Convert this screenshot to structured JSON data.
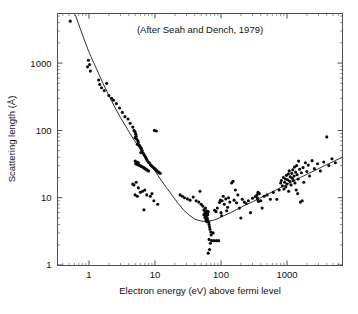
{
  "figure": {
    "title": "",
    "annotation": "(After Seah and Dench, 1979)",
    "background_color": "#ffffff",
    "frame_color": "#4d4d4d",
    "marker_color": "#0b0b0b",
    "curve_color": "#1a1a1a"
  },
  "axes": {
    "x": {
      "label": "Electron energy (eV) above fermi level",
      "scale": "log",
      "range": [
        0.4,
        7000
      ],
      "tick_labels": [
        "1",
        "10",
        "100",
        "1000"
      ],
      "tick_values": [
        1,
        10,
        100,
        1000
      ],
      "minor_ticks": true
    },
    "y": {
      "label": "Scattering length (Å)",
      "scale": "log",
      "range": [
        1,
        6000
      ],
      "tick_labels": [
        "1",
        "10",
        "100",
        "1000"
      ],
      "tick_values": [
        1,
        10,
        100,
        1000
      ],
      "minor_ticks": true
    }
  },
  "chart_data": {
    "type": "scatter",
    "title": "",
    "subtitle": "(After Seah and Dench, 1979)",
    "xlabel": "Electron energy (eV) above fermi level",
    "ylabel": "Scattering length (Å)",
    "xscale": "log",
    "yscale": "log",
    "xlim": [
      0.4,
      7000
    ],
    "ylim": [
      1,
      6000
    ],
    "grid": false,
    "legend": false,
    "series": [
      {
        "name": "Experimental scattering length measurements",
        "marker": "circle",
        "color": "#0b0b0b",
        "points": [
          [
            0.52,
            4200
          ],
          [
            0.95,
            880
          ],
          [
            0.98,
            1100
          ],
          [
            1.02,
            950
          ],
          [
            1.05,
            760
          ],
          [
            1.4,
            560
          ],
          [
            1.45,
            480
          ],
          [
            1.55,
            430
          ],
          [
            1.7,
            390
          ],
          [
            1.85,
            500
          ],
          [
            2.0,
            330
          ],
          [
            2.2,
            300
          ],
          [
            2.35,
            280
          ],
          [
            2.6,
            250
          ],
          [
            2.9,
            215
          ],
          [
            3.2,
            185
          ],
          [
            3.5,
            160
          ],
          [
            3.9,
            148
          ],
          [
            4.2,
            128
          ],
          [
            4.6,
            112
          ],
          [
            4.8,
            100
          ],
          [
            5.0,
            95
          ],
          [
            5.1,
            88
          ],
          [
            5.2,
            82
          ],
          [
            5.0,
            78
          ],
          [
            5.3,
            74
          ],
          [
            5.5,
            70
          ],
          [
            5.6,
            66
          ],
          [
            5.4,
            62
          ],
          [
            5.8,
            60
          ],
          [
            6.0,
            57
          ],
          [
            6.2,
            54
          ],
          [
            6.4,
            50
          ],
          [
            6.1,
            47
          ],
          [
            6.6,
            46
          ],
          [
            6.8,
            44
          ],
          [
            7.0,
            42
          ],
          [
            7.2,
            40
          ],
          [
            7.4,
            38
          ],
          [
            7.6,
            36
          ],
          [
            7.9,
            34
          ],
          [
            8.2,
            33
          ],
          [
            8.5,
            31
          ],
          [
            8.8,
            30
          ],
          [
            9.1,
            29
          ],
          [
            9.5,
            28
          ],
          [
            9.9,
            27
          ],
          [
            10.3,
            26
          ],
          [
            10.7,
            25
          ],
          [
            11.2,
            24
          ],
          [
            11.6,
            23.5
          ],
          [
            12.0,
            23
          ],
          [
            5.0,
            35
          ],
          [
            5.2,
            34
          ],
          [
            5.4,
            33.5
          ],
          [
            5.6,
            33
          ],
          [
            5.1,
            32
          ],
          [
            5.3,
            31.5
          ],
          [
            5.5,
            31
          ],
          [
            5.7,
            30.5
          ],
          [
            5.9,
            30
          ],
          [
            6.1,
            29.5
          ],
          [
            6.3,
            29
          ],
          [
            6.5,
            28.5
          ],
          [
            6.7,
            28
          ],
          [
            6.9,
            27.5
          ],
          [
            7.1,
            27
          ],
          [
            7.3,
            26.5
          ],
          [
            7.5,
            26
          ],
          [
            7.7,
            25.5
          ],
          [
            8.0,
            25
          ],
          [
            9.8,
            100
          ],
          [
            10.5,
            98
          ],
          [
            4.6,
            16
          ],
          [
            4.8,
            15.5
          ],
          [
            5.2,
            17
          ],
          [
            5.6,
            14
          ],
          [
            5.0,
            11
          ],
          [
            5.4,
            10.5
          ],
          [
            6.0,
            12
          ],
          [
            6.5,
            12.5
          ],
          [
            7.0,
            13
          ],
          [
            7.5,
            11
          ],
          [
            6.8,
            6.6
          ],
          [
            8.5,
            10.5
          ],
          [
            9.0,
            11.5
          ],
          [
            9.6,
            9.0
          ],
          [
            11.0,
            8.0
          ],
          [
            24,
            11
          ],
          [
            26,
            10.5
          ],
          [
            28,
            10
          ],
          [
            31,
            9.6
          ],
          [
            34,
            9.2
          ],
          [
            38,
            10.2
          ],
          [
            42,
            9.0
          ],
          [
            46,
            8.6
          ],
          [
            48,
            12.5
          ],
          [
            50,
            8.0
          ],
          [
            53,
            7.5
          ],
          [
            55,
            6.6
          ],
          [
            57,
            6.2
          ],
          [
            58,
            5.8
          ],
          [
            60,
            5.4
          ],
          [
            62,
            5.0
          ],
          [
            63,
            4.6
          ],
          [
            65,
            4.3
          ],
          [
            66,
            4.0
          ],
          [
            67,
            3.7
          ],
          [
            68,
            3.4
          ],
          [
            70,
            3.1
          ],
          [
            71,
            2.8
          ],
          [
            66,
            2.4
          ],
          [
            69,
            2.1
          ],
          [
            67,
            1.7
          ],
          [
            64,
            1.5
          ],
          [
            58,
            7.0
          ],
          [
            60,
            6.4
          ],
          [
            62,
            6.0
          ],
          [
            55,
            5.6
          ],
          [
            57,
            5.1
          ],
          [
            59,
            4.7
          ],
          [
            61,
            4.4
          ],
          [
            63,
            5.6
          ],
          [
            64,
            6.2
          ],
          [
            72,
            2.3
          ],
          [
            78,
            2.3
          ],
          [
            85,
            2.3
          ],
          [
            92,
            2.3
          ],
          [
            76,
            3.0
          ],
          [
            80,
            6.5
          ],
          [
            84,
            6.2
          ],
          [
            88,
            7.0
          ],
          [
            95,
            8.5
          ],
          [
            98,
            9.2
          ],
          [
            100,
            6.0
          ],
          [
            102,
            5.4
          ],
          [
            104,
            9.0
          ],
          [
            108,
            10.5
          ],
          [
            112,
            8.0
          ],
          [
            118,
            9.6
          ],
          [
            122,
            6.4
          ],
          [
            126,
            7.2
          ],
          [
            130,
            10.0
          ],
          [
            136,
            8.6
          ],
          [
            145,
            16.5
          ],
          [
            152,
            17.5
          ],
          [
            158,
            9.2
          ],
          [
            165,
            13.0
          ],
          [
            172,
            8.4
          ],
          [
            180,
            11.0
          ],
          [
            190,
            7.0
          ],
          [
            200,
            5.0
          ],
          [
            210,
            9.5
          ],
          [
            225,
            8.6
          ],
          [
            240,
            8.2
          ],
          [
            260,
            9.0
          ],
          [
            280,
            6.0
          ],
          [
            300,
            9.8
          ],
          [
            330,
            10.4
          ],
          [
            350,
            11.0
          ],
          [
            355,
            10.0
          ],
          [
            360,
            9.4
          ],
          [
            365,
            12.0
          ],
          [
            370,
            8.8
          ],
          [
            380,
            11.5
          ],
          [
            400,
            9.0
          ],
          [
            420,
            7.0
          ],
          [
            450,
            10.5
          ],
          [
            500,
            11.0
          ],
          [
            560,
            9.5
          ],
          [
            620,
            12.0
          ],
          [
            700,
            9.5
          ],
          [
            760,
            13.0
          ],
          [
            800,
            16.5
          ],
          [
            820,
            18.0
          ],
          [
            850,
            15.0
          ],
          [
            880,
            20.0
          ],
          [
            900,
            13.5
          ],
          [
            920,
            17.0
          ],
          [
            950,
            19.0
          ],
          [
            960,
            14.5
          ],
          [
            980,
            21.5
          ],
          [
            1000,
            16.0
          ],
          [
            1020,
            18.5
          ],
          [
            1050,
            22.5
          ],
          [
            1060,
            12.5
          ],
          [
            1080,
            25.0
          ],
          [
            1100,
            17.5
          ],
          [
            1120,
            20.5
          ],
          [
            1150,
            15.5
          ],
          [
            1180,
            23.0
          ],
          [
            1200,
            19.5
          ],
          [
            1220,
            26.0
          ],
          [
            1250,
            18.0
          ],
          [
            1280,
            21.0
          ],
          [
            1300,
            28.5
          ],
          [
            1320,
            16.5
          ],
          [
            1350,
            24.0
          ],
          [
            1380,
            13.0
          ],
          [
            1400,
            30.0
          ],
          [
            1420,
            22.0
          ],
          [
            1450,
            11.5
          ],
          [
            1480,
            19.0
          ],
          [
            1500,
            35.0
          ],
          [
            1550,
            26.5
          ],
          [
            1600,
            8.6
          ],
          [
            1650,
            23.5
          ],
          [
            1700,
            9.0
          ],
          [
            1750,
            28.0
          ],
          [
            1800,
            17.0
          ],
          [
            1900,
            33.0
          ],
          [
            2000,
            24.5
          ],
          [
            2100,
            30.5
          ],
          [
            2200,
            21.0
          ],
          [
            2400,
            35.5
          ],
          [
            2600,
            27.0
          ],
          [
            2900,
            32.0
          ],
          [
            3200,
            25.0
          ],
          [
            3600,
            34.0
          ],
          [
            4000,
            80.0
          ],
          [
            4300,
            30.0
          ],
          [
            4800,
            38.0
          ],
          [
            5400,
            33.0
          ]
        ]
      }
    ],
    "fit_curve": {
      "name": "Universal curve fit",
      "color": "#1a1a1a",
      "points": [
        [
          0.62,
          5200
        ],
        [
          0.8,
          2600
        ],
        [
          1.0,
          1450
        ],
        [
          1.3,
          820
        ],
        [
          1.6,
          520
        ],
        [
          2.0,
          330
        ],
        [
          2.5,
          215
        ],
        [
          3.0,
          155
        ],
        [
          3.6,
          115
        ],
        [
          4.3,
          86
        ],
        [
          5.0,
          68
        ],
        [
          6.0,
          52
        ],
        [
          7.0,
          41
        ],
        [
          8.5,
          31
        ],
        [
          10.0,
          25
        ],
        [
          12.0,
          19
        ],
        [
          15.0,
          14
        ],
        [
          18.0,
          11
        ],
        [
          22.0,
          8.4
        ],
        [
          27.0,
          6.6
        ],
        [
          33.0,
          5.5
        ],
        [
          40.0,
          4.8
        ],
        [
          50.0,
          4.5
        ],
        [
          60.0,
          4.4
        ],
        [
          75.0,
          4.6
        ],
        [
          90.0,
          4.9
        ],
        [
          110.0,
          5.4
        ],
        [
          140.0,
          6.0
        ],
        [
          180.0,
          6.8
        ],
        [
          230.0,
          7.7
        ],
        [
          300.0,
          8.7
        ],
        [
          400.0,
          10.0
        ],
        [
          520.0,
          11.4
        ],
        [
          700.0,
          13.2
        ],
        [
          900.0,
          15.0
        ],
        [
          1200.0,
          17.3
        ],
        [
          1600.0,
          20.0
        ],
        [
          2200.0,
          23.3
        ],
        [
          3000.0,
          27.0
        ],
        [
          4000.0,
          31.0
        ],
        [
          5500.0,
          36.0
        ],
        [
          6800.0,
          39.5
        ]
      ]
    }
  }
}
